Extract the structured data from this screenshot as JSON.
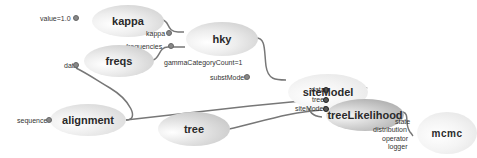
{
  "diagram": {
    "type": "model-graph",
    "nodes": [
      {
        "id": "kappa",
        "label": "kappa"
      },
      {
        "id": "hky",
        "label": "hky"
      },
      {
        "id": "freqs",
        "label": "freqs"
      },
      {
        "id": "siteModel",
        "label": "siteModel"
      },
      {
        "id": "alignment",
        "label": "alignment"
      },
      {
        "id": "tree",
        "label": "tree"
      },
      {
        "id": "treeLikelihood",
        "label": "treeLikelihood"
      },
      {
        "id": "mcmc",
        "label": "mcmc"
      }
    ],
    "ports": {
      "kappa_value": "value=1.0",
      "hky_kappa": "kappa",
      "hky_frequencies": "frequencies",
      "freqs_data": "data",
      "sitemodel_gamma": "gammaCategoryCount=1",
      "sitemodel_substmodel": "substModel",
      "alignment_sequence": "sequence",
      "tl_data": "data",
      "tl_tree": "tree",
      "tl_sitemodel": "siteModel",
      "mcmc_state": "state",
      "mcmc_distribution": "distribution",
      "mcmc_operator": "operator",
      "mcmc_logger": "logger"
    },
    "edges": [
      {
        "from": "kappa",
        "to": "hky",
        "port": "kappa"
      },
      {
        "from": "freqs",
        "to": "hky",
        "port": "frequencies"
      },
      {
        "from": "alignment",
        "to": "freqs",
        "port": "data"
      },
      {
        "from": "hky",
        "to": "siteModel",
        "port": "substModel"
      },
      {
        "from": "alignment",
        "to": "treeLikelihood",
        "port": "data"
      },
      {
        "from": "siteModel",
        "to": "treeLikelihood",
        "port": "siteModel"
      },
      {
        "from": "tree",
        "to": "treeLikelihood",
        "port": "tree"
      },
      {
        "from": "treeLikelihood",
        "to": "mcmc",
        "port": "distribution"
      }
    ]
  }
}
